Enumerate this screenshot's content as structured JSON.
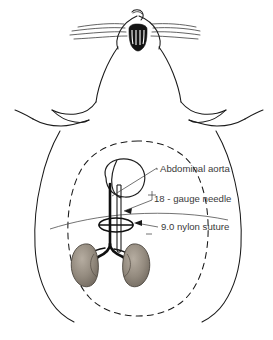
{
  "figure": {
    "background_color": "#ffffff",
    "ink_color": "#1a1a1a",
    "text_color": "#3a3a3a",
    "kidney_fill": "#8c8378",
    "subject_view": "ventral supine view of rodent, head at top"
  },
  "labels": [
    {
      "id": "abdominal-aorta",
      "text": "Abdominal aorta",
      "x": 160,
      "y": 172
    },
    {
      "id": "gauge-needle",
      "text": "18 - gauge needle",
      "x": 154,
      "y": 202
    },
    {
      "id": "nylon-suture",
      "text": "9.0 nylon suture",
      "x": 161,
      "y": 230
    }
  ],
  "anatomy": {
    "parts": [
      "head-and-snout",
      "whiskers",
      "body-outline",
      "abdominal-cavity-dashed",
      "stomach",
      "abdominal-aorta",
      "iliac-bifurcation",
      "left-kidney",
      "right-kidney",
      "needle",
      "suture-loop"
    ]
  }
}
